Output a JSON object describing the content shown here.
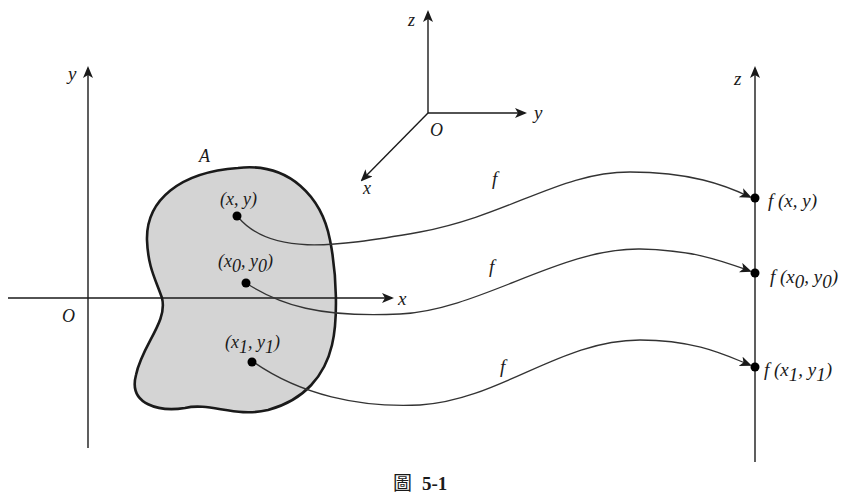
{
  "figure": {
    "caption_prefix": "圖",
    "caption_number": "5-1"
  },
  "colors": {
    "stroke": "#1a1a1a",
    "curve": "#333333",
    "region_fill": "#d4d4d4",
    "background": "#ffffff"
  },
  "plane_axes": {
    "origin_label": "O",
    "x_label": "x",
    "y_label": "y"
  },
  "space_axes": {
    "origin_label": "O",
    "x_label": "x",
    "y_label": "y",
    "z_label": "z"
  },
  "region": {
    "label": "A"
  },
  "points": [
    {
      "label_main": "(x, y)",
      "label_parts": [
        "(x, y)"
      ],
      "image_label": "f (x, y)",
      "map_label": "f"
    },
    {
      "label_parts": [
        "(x",
        "0",
        ", y",
        "0",
        ")"
      ],
      "image_parts": [
        "f (x",
        "0",
        ", y",
        "0",
        ")"
      ],
      "map_label": "f"
    },
    {
      "label_parts": [
        "(x",
        "1",
        ", y",
        "1",
        ")"
      ],
      "image_parts": [
        "f (x",
        "1",
        ", y",
        "1",
        ")"
      ],
      "map_label": "f"
    }
  ],
  "z_axis": {
    "label": "z"
  }
}
